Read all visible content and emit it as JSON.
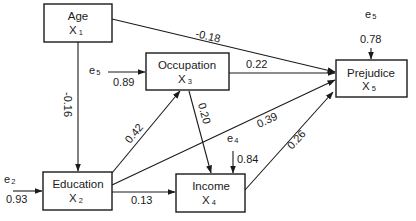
{
  "diagram": {
    "type": "path-diagram",
    "nodes": [
      {
        "id": "x1",
        "name": "Age",
        "var": "X",
        "sub": "1"
      },
      {
        "id": "x2",
        "name": "Education",
        "var": "X",
        "sub": "2"
      },
      {
        "id": "x3",
        "name": "Occupation",
        "var": "X",
        "sub": "3"
      },
      {
        "id": "x4",
        "name": "Income",
        "var": "X",
        "sub": "4"
      },
      {
        "id": "x5",
        "name": "Prejudice",
        "var": "X",
        "sub": "5"
      }
    ],
    "edges": [
      {
        "from": "x1",
        "to": "x5",
        "coef": "-0.18"
      },
      {
        "from": "x1",
        "to": "x2",
        "coef": "-0.16"
      },
      {
        "from": "x3",
        "to": "x5",
        "coef": "0.22"
      },
      {
        "from": "x2",
        "to": "x3",
        "coef": "0.42"
      },
      {
        "from": "x3",
        "to": "x4",
        "coef": "0.20"
      },
      {
        "from": "x2",
        "to": "x5",
        "coef": "0.39"
      },
      {
        "from": "x2",
        "to": "x4",
        "coef": "0.13"
      },
      {
        "from": "x4",
        "to": "x5",
        "coef": "0.26"
      }
    ],
    "errors": [
      {
        "label": "e",
        "sub": "5",
        "target": "x3",
        "coef": "0.89"
      },
      {
        "label": "e",
        "sub": "2",
        "target": "x2",
        "coef": "0.93"
      },
      {
        "label": "e",
        "sub": "4",
        "target": "x4",
        "coef": "0.84"
      },
      {
        "label": "e",
        "sub": "5",
        "target": "x5",
        "coef": "0.78"
      }
    ]
  }
}
